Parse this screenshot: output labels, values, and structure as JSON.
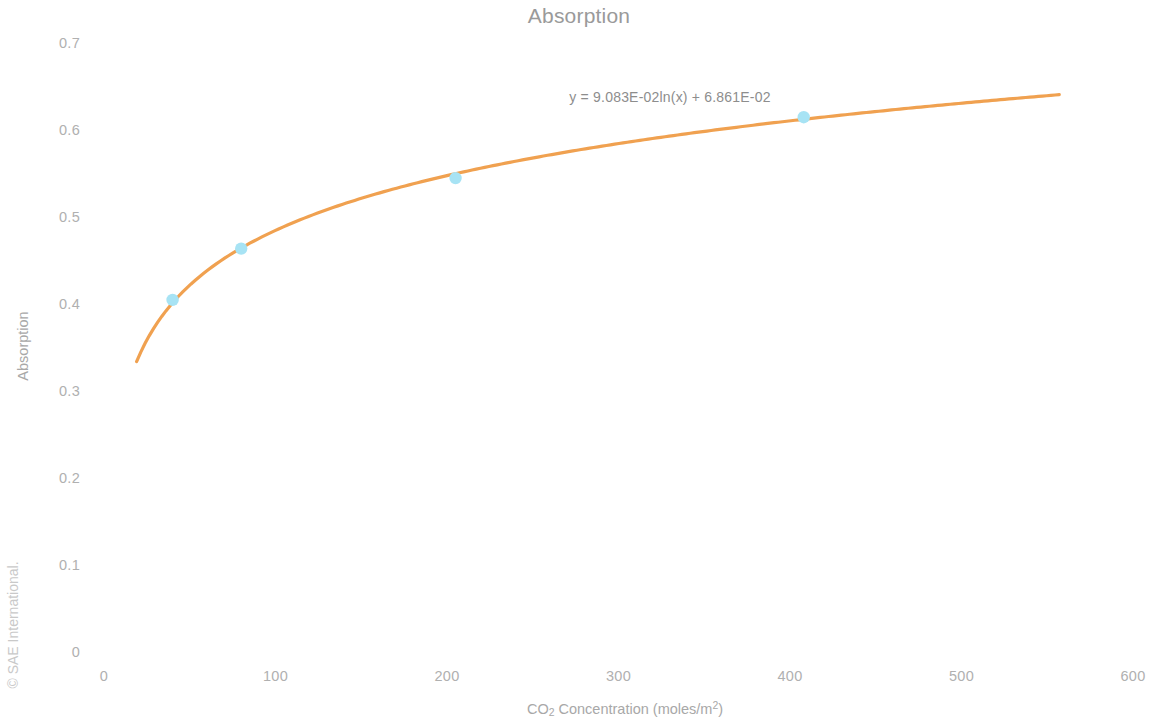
{
  "chart_data": {
    "type": "scatter",
    "title": "Absorption",
    "xlabel": "CO2 Concentration (moles/m2)",
    "xlabel_parts": {
      "pre": "CO",
      "sub": "2",
      "mid": " Concentration (moles/m",
      "sup": "2",
      "post": ")"
    },
    "ylabel": "Absorption",
    "xlim": [
      0,
      600
    ],
    "ylim": [
      0,
      0.7
    ],
    "xticks": [
      "0",
      "100",
      "200",
      "300",
      "400",
      "500",
      "600"
    ],
    "xtick_values": [
      0,
      100,
      200,
      300,
      400,
      500,
      600
    ],
    "yticks": [
      "0",
      "0.1",
      "0.2",
      "0.3",
      "0.4",
      "0.5",
      "0.6",
      "0.7"
    ],
    "ytick_values": [
      0,
      0.1,
      0.2,
      0.3,
      0.4,
      0.5,
      0.6,
      0.7
    ],
    "grid": false,
    "legend": "none",
    "annotation": "y = 9.083E-02ln(x) + 6.861E-02",
    "series": [
      {
        "name": "Absorption",
        "type": "scatter",
        "marker_color": "#A7E3F4",
        "x": [
          40,
          80,
          205,
          408
        ],
        "y": [
          0.407,
          0.466,
          0.547,
          0.617
        ]
      },
      {
        "name": "Logarithmic trendline",
        "type": "line",
        "line_color": "#F0A150",
        "equation": "y = 0.09083*ln(x) + 0.06861",
        "coefficient": 0.09083,
        "intercept": 0.06861,
        "x_range": [
          19,
          557
        ]
      }
    ]
  },
  "footer": {
    "copyright": "© SAE International."
  },
  "icons": {
    "data_point": "circle-marker"
  }
}
